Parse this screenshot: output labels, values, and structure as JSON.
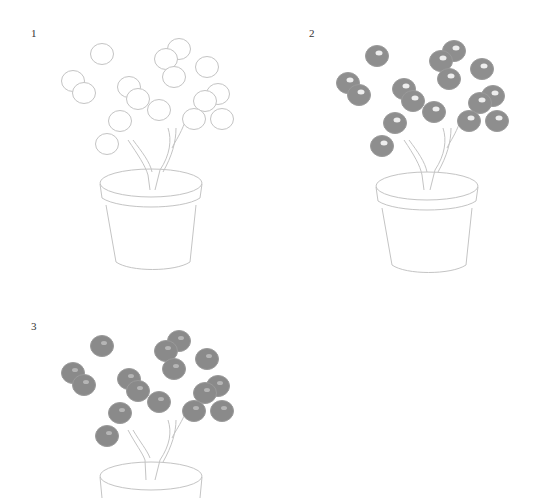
{
  "colors": {
    "background": "#ffffff",
    "pencil_line": "#bcbcbc",
    "berry_fill": "#8e8e8e",
    "berry_highlight": "#ededed",
    "step_number": "#333333"
  },
  "steps": [
    {
      "number": "1",
      "style": "outline"
    },
    {
      "number": "2",
      "style": "shaded_with_highlight"
    },
    {
      "number": "3",
      "style": "shaded_soft"
    }
  ],
  "berries": [
    [
      102,
      54
    ],
    [
      179,
      49
    ],
    [
      166,
      59
    ],
    [
      207,
      67
    ],
    [
      174,
      77
    ],
    [
      73,
      81
    ],
    [
      84,
      93
    ],
    [
      129,
      87
    ],
    [
      138,
      99
    ],
    [
      159,
      110
    ],
    [
      218,
      94
    ],
    [
      205,
      101
    ],
    [
      194,
      119
    ],
    [
      222,
      119
    ],
    [
      120,
      121
    ],
    [
      107,
      144
    ]
  ]
}
